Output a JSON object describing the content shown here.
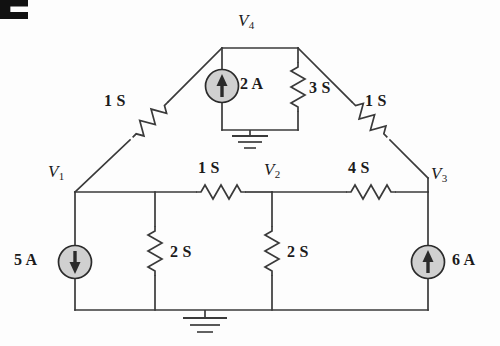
{
  "figure": {
    "corner_mark": "partial-bold-glyph",
    "background_color": "#fdfdfd",
    "line_color": "#3a3a3a",
    "source_fill_color": "#d0d0d0",
    "source_stroke_color": "#2b2b2b",
    "text_color": "#1b1b1b"
  },
  "nodes": [
    {
      "id": "v1",
      "label": "V",
      "sub": "1",
      "x": 75,
      "y": 192
    },
    {
      "id": "v2",
      "label": "V",
      "sub": "2",
      "x": 272,
      "y": 192
    },
    {
      "id": "v3",
      "label": "V",
      "sub": "3",
      "x": 428,
      "y": 192
    },
    {
      "id": "v4",
      "label": "V",
      "sub": "4",
      "x": 250,
      "y": 48
    }
  ],
  "node_labels": [
    {
      "name": "node-label-v1",
      "text": "V",
      "sub": "1",
      "left": 48,
      "top": 165
    },
    {
      "name": "node-label-v2",
      "text": "V",
      "sub": "2",
      "left": 264,
      "top": 163
    },
    {
      "name": "node-label-v3",
      "text": "V",
      "sub": "3",
      "left": 430,
      "top": 167
    },
    {
      "name": "node-label-v4",
      "text": "V",
      "sub": "4",
      "left": 238,
      "top": 12
    }
  ],
  "resistors": [
    {
      "name": "resistor-1s-left-diagonal",
      "value": "1 S",
      "orientation": "diagonal-down-left",
      "label_left": 104,
      "label_top": 93
    },
    {
      "name": "resistor-1s-right-diagonal",
      "value": "1 S",
      "orientation": "diagonal-down-right",
      "label_left": 365,
      "label_top": 93
    },
    {
      "name": "resistor-3s-vertical",
      "value": "3 S",
      "orientation": "vertical",
      "label_left": 307,
      "label_top": 81
    },
    {
      "name": "resistor-1s-middle",
      "value": "1 S",
      "orientation": "horizontal",
      "label_left": 196,
      "label_top": 163
    },
    {
      "name": "resistor-4s-middle",
      "value": "4 S",
      "orientation": "horizontal",
      "label_left": 346,
      "label_top": 163
    },
    {
      "name": "resistor-2s-left",
      "value": "2 S",
      "orientation": "vertical",
      "label_left": 169,
      "label_top": 245
    },
    {
      "name": "resistor-2s-right",
      "value": "2 S",
      "orientation": "vertical",
      "label_left": 286,
      "label_top": 245
    }
  ],
  "sources": [
    {
      "name": "current-source-5a",
      "value": "5 A",
      "direction": "down",
      "cx": 75,
      "cy": 262,
      "label_left": 14,
      "label_top": 253
    },
    {
      "name": "current-source-2a",
      "value": "2 A",
      "direction": "up",
      "cx": 222,
      "cy": 86,
      "label_left": 238,
      "label_top": 77
    },
    {
      "name": "current-source-6a",
      "value": "6 A",
      "direction": "up",
      "cx": 428,
      "cy": 262,
      "label_left": 452,
      "label_top": 253
    }
  ],
  "grounds": [
    {
      "name": "ground-symbol-top",
      "x": 250,
      "y": 130
    },
    {
      "name": "ground-symbol-bottom",
      "x": 205,
      "y": 310
    }
  ]
}
